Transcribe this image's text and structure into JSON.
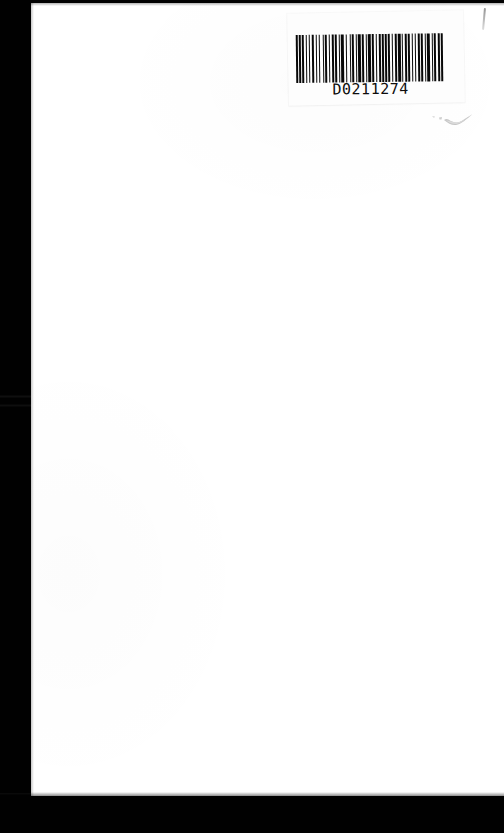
{
  "document": {
    "kind": "scanned-page",
    "page_state": "blank",
    "page_body_text": "",
    "background_color": "#010101",
    "paper_color": "#ffffff"
  },
  "scan": {
    "width_px": 504,
    "height_px": 833,
    "left_margin_band_px": 31,
    "bottom_margin_band_px": 37
  },
  "barcode_label": {
    "code_text": "D0211274",
    "symbology": "Code 39",
    "label_color": "#fdfdfd",
    "bar_color": "#080808",
    "bar_pattern": [
      3,
      2,
      2,
      2,
      4,
      2,
      2,
      3,
      2,
      2,
      4,
      3,
      2,
      2,
      2,
      4,
      2,
      2,
      3,
      3,
      2,
      2,
      4,
      2,
      3,
      2,
      2,
      2,
      4,
      3,
      2,
      4,
      2,
      2,
      3,
      2,
      2,
      2,
      4,
      2,
      3,
      3,
      2,
      2,
      4,
      2,
      2,
      3,
      2,
      4,
      2,
      2,
      3,
      2,
      2,
      2,
      4,
      2,
      2,
      3,
      3,
      2,
      4,
      2,
      2,
      2,
      3,
      2,
      4,
      2,
      2,
      3,
      2,
      2,
      4,
      2,
      3,
      2,
      2,
      2,
      4,
      3,
      2,
      2,
      2,
      4,
      2,
      2,
      3,
      2
    ]
  },
  "marks": {
    "pencil_tick_label": "pencil-tick",
    "smudge_label": "gray-smudge"
  }
}
